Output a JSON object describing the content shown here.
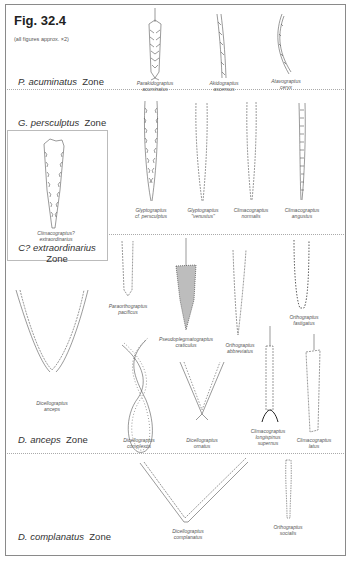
{
  "figure": {
    "title": "Fig. 32.4",
    "note": "(all figures approx. ×2)"
  },
  "zones": [
    {
      "id": "acuminatus",
      "name": "P. acuminatus",
      "suffix": "Zone"
    },
    {
      "id": "persculptus",
      "name": "G. persculptus",
      "suffix": "Zone"
    },
    {
      "id": "extraordinarius",
      "name": "C? extraordinarius",
      "suffix": "Zone"
    },
    {
      "id": "anceps",
      "name": "D. anceps",
      "suffix": "Zone"
    },
    {
      "id": "complanatus",
      "name": "D. complanatus",
      "suffix": "Zone"
    }
  ],
  "specimens": {
    "parakidograptus_acuminatus": {
      "line1": "Parakidograptus",
      "line2": "acuminatus"
    },
    "akidograptus_ascensus": {
      "line1": "Akidograptus",
      "line2": "ascensus"
    },
    "atavograptus_ceryx": {
      "line1": "Atavograptus",
      "line2": "ceryx"
    },
    "glyptograptus_persculptus": {
      "line1": "Glyptograptus",
      "line2": "cf. persculptus"
    },
    "glyptograptus_venustus": {
      "line1": "Glyptograptus",
      "line2": "\"venustus\""
    },
    "climacograptus_normalis": {
      "line1": "Climacograptus",
      "line2": "normalis"
    },
    "climacograptus_angustus": {
      "line1": "Climacograptus",
      "line2": "angustus"
    },
    "climacograptus_extraordinarius": {
      "line1": "Climacograptus?",
      "line2": "extraordinarius"
    },
    "paraorthograptus_pacificus": {
      "line1": "Paraorthograptus",
      "line2": "pacificus"
    },
    "pseudoplegmatograptus_craticulus": {
      "line1": "Pseudoplegmatograptus",
      "line2": "craticulus"
    },
    "orthograptus_abbreviatus": {
      "line1": "Orthograptus",
      "line2": "abbreviatus"
    },
    "orthograptus_fastigatus": {
      "line1": "Orthograptus",
      "line2": "fastigatus"
    },
    "dicellograptus_anceps": {
      "line1": "Dicellograptus",
      "line2": "anceps"
    },
    "dicellograptus_complexus": {
      "line1": "Dicellograptus",
      "line2": "complexus"
    },
    "dicellograptus_ornatus": {
      "line1": "Dicellograptus",
      "line2": "ornatus"
    },
    "climacograptus_longispinus": {
      "line1": "Climacograptus",
      "line2": "longispinus",
      "line3": "supernus"
    },
    "climacograptus_latus": {
      "line1": "Climacograptus",
      "line2": "latus"
    },
    "dicellograptus_complanatus": {
      "line1": "Dicellograptus",
      "line2": "complanatus"
    },
    "orthograptus_socialis": {
      "line1": "Orthograptus",
      "line2": "socialis"
    }
  }
}
